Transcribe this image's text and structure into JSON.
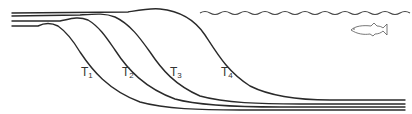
{
  "diagram": {
    "labels": [
      {
        "id": "T1",
        "main": "T",
        "sub": "1",
        "x": 81,
        "y": 66
      },
      {
        "id": "T2",
        "main": "T",
        "sub": "2",
        "x": 122,
        "y": 66
      },
      {
        "id": "T3",
        "main": "T",
        "sub": "3",
        "x": 170,
        "y": 66
      },
      {
        "id": "T4",
        "main": "T",
        "sub": "4",
        "x": 221,
        "y": 66
      }
    ],
    "colors": {
      "stroke": "#2a2a2a",
      "background": "#ffffff"
    },
    "icons": [
      "water-surface-waves",
      "fish-icon"
    ]
  }
}
